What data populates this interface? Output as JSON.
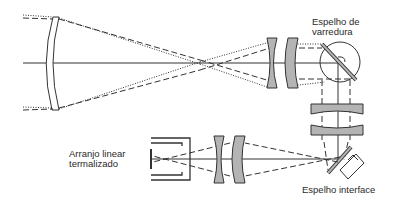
{
  "diagram": {
    "type": "optical-schematic",
    "labels": {
      "scan_mirror_line1": "Espelho de",
      "scan_mirror_line2": "varredura",
      "array_line1": "Arranjo linear",
      "array_line2": "termalizado",
      "interface_mirror": "Espelho interface"
    },
    "components": [
      "primary-mirror",
      "field-lens-1",
      "field-lens-2",
      "scan-mirror",
      "relay-lens-1",
      "relay-lens-2",
      "interface-mirror",
      "imaging-lens-1",
      "imaging-lens-2",
      "detector-array"
    ],
    "colors": {
      "line": "#333333",
      "lens_fill": "#b4b4b4",
      "background": "#ffffff"
    }
  }
}
